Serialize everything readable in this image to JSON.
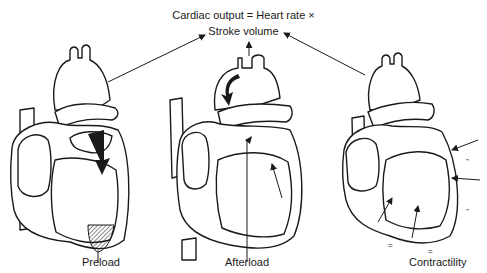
{
  "diagram": {
    "equation_line1": "Cardiac output = Heart rate ×",
    "equation_line2": "Stroke volume",
    "panels": [
      {
        "label": "Preload",
        "icon": "heart-preload-icon"
      },
      {
        "label": "Afterload",
        "icon": "heart-afterload-icon"
      },
      {
        "label": "Contractility",
        "icon": "heart-contractility-icon"
      }
    ],
    "line_color": "#1a1a1a",
    "background": "#ffffff"
  }
}
